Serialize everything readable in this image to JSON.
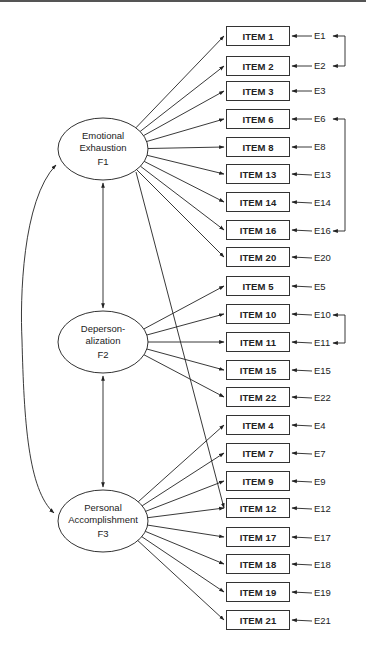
{
  "diagram": {
    "type": "structural-equation-model",
    "factors": [
      {
        "id": "F1",
        "name_line1": "Emotional",
        "name_line2": "Exhaustion",
        "label": "F1",
        "cx": 103,
        "cy": 149
      },
      {
        "id": "F2",
        "name_line1": "Deperson-",
        "name_line2": "alization",
        "label": "F2",
        "cx": 103,
        "cy": 342
      },
      {
        "id": "F3",
        "name_line1": "Personal",
        "name_line2": "Accomplishment",
        "label": "F3",
        "cx": 103,
        "cy": 521
      }
    ],
    "items": [
      {
        "label": "ITEM 1",
        "error": "E1",
        "factor": "F1",
        "y": 26
      },
      {
        "label": "ITEM 2",
        "error": "E2",
        "factor": "F1",
        "y": 56
      },
      {
        "label": "ITEM 3",
        "error": "E3",
        "factor": "F1",
        "y": 81
      },
      {
        "label": "ITEM 6",
        "error": "E6",
        "factor": "F1",
        "y": 109
      },
      {
        "label": "ITEM 8",
        "error": "E8",
        "factor": "F1",
        "y": 137
      },
      {
        "label": "ITEM 13",
        "error": "E13",
        "factor": "F1",
        "y": 164
      },
      {
        "label": "ITEM 14",
        "error": "E14",
        "factor": "F1",
        "y": 192
      },
      {
        "label": "ITEM 16",
        "error": "E16",
        "factor": "F1",
        "y": 220
      },
      {
        "label": "ITEM 20",
        "error": "E20",
        "factor": "F1",
        "y": 247
      },
      {
        "label": "ITEM 5",
        "error": "E5",
        "factor": "F2",
        "y": 276
      },
      {
        "label": "ITEM 10",
        "error": "E10",
        "factor": "F2",
        "y": 304
      },
      {
        "label": "ITEM 11",
        "error": "E11",
        "factor": "F2",
        "y": 332
      },
      {
        "label": "ITEM 15",
        "error": "E15",
        "factor": "F2",
        "y": 360
      },
      {
        "label": "ITEM 22",
        "error": "E22",
        "factor": "F2",
        "y": 387
      },
      {
        "label": "ITEM 4",
        "error": "E4",
        "factor": "F3",
        "y": 415
      },
      {
        "label": "ITEM 7",
        "error": "E7",
        "factor": "F3",
        "y": 443
      },
      {
        "label": "ITEM 9",
        "error": "E9",
        "factor": "F3",
        "y": 471
      },
      {
        "label": "ITEM 12",
        "error": "E12",
        "factor": "F3",
        "y": 498
      },
      {
        "label": "ITEM 17",
        "error": "E17",
        "factor": "F3",
        "y": 527
      },
      {
        "label": "ITEM 18",
        "error": "E18",
        "factor": "F3",
        "y": 554
      },
      {
        "label": "ITEM 19",
        "error": "E19",
        "factor": "F3",
        "y": 582
      },
      {
        "label": "ITEM 21",
        "error": "E21",
        "factor": "F3",
        "y": 610
      }
    ],
    "cross_loadings": [
      {
        "from": "F1",
        "to": "ITEM 12"
      }
    ],
    "error_covariances": [
      [
        "E1",
        "E2"
      ],
      [
        "E6",
        "E16"
      ],
      [
        "E10",
        "E11"
      ]
    ],
    "factor_covariances": [
      [
        "F1",
        "F2"
      ],
      [
        "F2",
        "F3"
      ],
      [
        "F1",
        "F3"
      ]
    ]
  }
}
